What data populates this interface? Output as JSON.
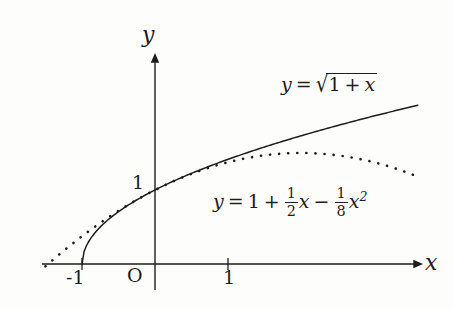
{
  "figure": {
    "background_color": "#fdfdfb",
    "ink_color": "#1d1d1d",
    "axes": {
      "x_axis_label": "x",
      "y_axis_label": "y",
      "origin_label": "O",
      "x_ticks": [
        {
          "value": -1,
          "label": "-1"
        },
        {
          "value": 1,
          "label": "1"
        }
      ],
      "y_ticks": [
        {
          "value": 1,
          "label": "1"
        }
      ]
    },
    "curve_labels": {
      "sqrt": {
        "y": "y",
        "equals": "=",
        "radicand_a": "1",
        "plus": "+",
        "radicand_b": "x"
      },
      "poly": {
        "y": "y",
        "equals": "=",
        "constant": "1",
        "plus": "+",
        "frac1_num": "1",
        "frac1_den": "2",
        "var1": "x",
        "minus": "−",
        "frac2_num": "1",
        "frac2_den": "8",
        "var2": "x",
        "exponent": "2"
      }
    }
  },
  "chart_data": {
    "type": "line",
    "title": "",
    "xlabel": "x",
    "ylabel": "y",
    "xlim": [
      -1.55,
      3.7
    ],
    "ylim": [
      -0.1,
      2.6
    ],
    "grid": false,
    "legend": "inline-curve-labels",
    "xticks": [
      -1,
      1
    ],
    "xticklabels": [
      "-1",
      "1"
    ],
    "yticks": [
      1
    ],
    "yticklabels": [
      "1"
    ],
    "series": [
      {
        "name": "y = sqrt(1+x)",
        "style": "solid",
        "x": [
          -1,
          -0.95,
          -0.9,
          -0.8,
          -0.7,
          -0.6,
          -0.5,
          -0.4,
          -0.3,
          -0.2,
          -0.1,
          0,
          0.25,
          0.5,
          0.75,
          1,
          1.25,
          1.5,
          1.75,
          2,
          2.25,
          2.5,
          2.75,
          3,
          3.25,
          3.5,
          3.6
        ],
        "values": [
          0,
          0.2236,
          0.3162,
          0.4472,
          0.5477,
          0.6325,
          0.7071,
          0.7746,
          0.8367,
          0.8944,
          0.9487,
          1,
          1.118,
          1.2247,
          1.3229,
          1.4142,
          1.5,
          1.5811,
          1.6583,
          1.7321,
          1.8028,
          1.8708,
          1.9365,
          2,
          2.0616,
          2.1213,
          2.1448
        ]
      },
      {
        "name": "y = 1 + (1/2)x - (1/8)x^2",
        "style": "dotted",
        "x": [
          -1.5,
          -1.4,
          -1.2,
          -1,
          -0.8,
          -0.6,
          -0.4,
          -0.2,
          0,
          0.25,
          0.5,
          0.75,
          1,
          1.25,
          1.5,
          1.75,
          2,
          2.25,
          2.5,
          2.75,
          3,
          3.25,
          3.5,
          3.6
        ],
        "values": [
          -0.0313,
          0.055,
          0.22,
          0.375,
          0.52,
          0.655,
          0.78,
          0.895,
          1,
          1.1172,
          1.2188,
          1.3047,
          1.375,
          1.4297,
          1.4688,
          1.4922,
          1.5,
          1.4922,
          1.4688,
          1.4297,
          1.375,
          1.3047,
          1.2188,
          1.185
        ]
      }
    ]
  }
}
